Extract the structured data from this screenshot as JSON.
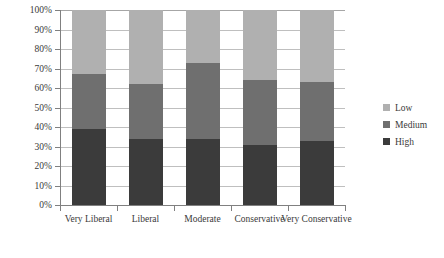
{
  "chart_data": {
    "type": "bar",
    "title": "",
    "subtitle": "",
    "xlabel": "",
    "ylabel": "",
    "stacked": true,
    "stack_mode": "percent",
    "grid": true,
    "legend_position": "right",
    "ylim": [
      0,
      100
    ],
    "ytick_labels": [
      "100%",
      "90%",
      "80%",
      "70%",
      "60%",
      "50%",
      "40%",
      "30%",
      "20%",
      "10%",
      "0%"
    ],
    "ytick_values": [
      100,
      90,
      80,
      70,
      60,
      50,
      40,
      30,
      20,
      10,
      0
    ],
    "categories": [
      "Very Liberal",
      "Liberal",
      "Moderate",
      "Conservative",
      "Very Conservative"
    ],
    "series": [
      {
        "name": "Low",
        "color": "#b0b0b0",
        "values": [
          33,
          38,
          27,
          36,
          37
        ]
      },
      {
        "name": "Medium",
        "color": "#6f6f6f",
        "values": [
          28,
          28,
          39,
          33,
          30
        ]
      },
      {
        "name": "High",
        "color": "#3b3b3b",
        "values": [
          39,
          34,
          34,
          31,
          33
        ]
      }
    ],
    "stack_boundaries_pct": [
      {
        "category": "Very Liberal",
        "high_top": 39,
        "medium_top": 67
      },
      {
        "category": "Liberal",
        "high_top": 34,
        "medium_top": 62
      },
      {
        "category": "Moderate",
        "high_top": 34,
        "medium_top": 73
      },
      {
        "category": "Conservative",
        "high_top": 31,
        "medium_top": 64
      },
      {
        "category": "Very Conservative",
        "high_top": 33,
        "medium_top": 63
      }
    ]
  },
  "legend": {
    "items": [
      {
        "label": "Low",
        "color": "#b0b0b0"
      },
      {
        "label": "Medium",
        "color": "#6f6f6f"
      },
      {
        "label": "High",
        "color": "#3b3b3b"
      }
    ]
  },
  "axes": {
    "y_labels": [
      "100%",
      "90%",
      "80%",
      "70%",
      "60%",
      "50%",
      "40%",
      "30%",
      "20%",
      "10%",
      "0%"
    ],
    "x_labels": [
      "Very Liberal",
      "Liberal",
      "Moderate",
      "Conservative",
      "Very Conservative"
    ]
  }
}
